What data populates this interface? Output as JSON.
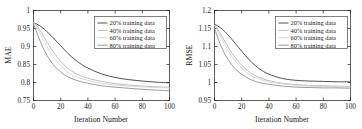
{
  "figure": {
    "panel_count": 2,
    "background": "#ffffff",
    "axis_color": "#1a1a1a"
  },
  "series_colors": [
    "#3d3d3d",
    "#b5b5b5",
    "#d2d2d2",
    "#8f8f8f"
  ],
  "legend": {
    "border_color": "#4a4a4a",
    "entries": [
      {
        "label": "20% training data",
        "color": "#3d3d3d"
      },
      {
        "label": "40% training data",
        "color": "#b5b5b5"
      },
      {
        "label": "60% training data",
        "color": "#d2d2d2"
      },
      {
        "label": "80% training data",
        "color": "#8f8f8f"
      }
    ]
  },
  "chart_data": [
    {
      "type": "line",
      "title": "",
      "xlabel": "Iteration Number",
      "ylabel": "MAE",
      "xlim": [
        0,
        100
      ],
      "ylim": [
        0.75,
        1
      ],
      "xticks": [
        0,
        20,
        40,
        60,
        80,
        100
      ],
      "yticks": [
        0.75,
        0.8,
        0.85,
        0.9,
        0.95,
        1
      ],
      "xticklabels": [
        "0",
        "20",
        "40",
        "60",
        "80",
        "100"
      ],
      "yticklabels": [
        "0.75",
        "0.8",
        "0.85",
        "0.9",
        "0.95",
        "1"
      ],
      "grid": false,
      "legend_position": "upper right",
      "x": [
        0,
        2,
        4,
        6,
        8,
        10,
        13,
        16,
        20,
        25,
        30,
        35,
        40,
        50,
        60,
        70,
        80,
        90,
        100
      ],
      "series": [
        {
          "name": "20% training data",
          "color": "#3d3d3d",
          "values": [
            0.966,
            0.963,
            0.959,
            0.954,
            0.948,
            0.941,
            0.93,
            0.918,
            0.902,
            0.882,
            0.865,
            0.851,
            0.84,
            0.824,
            0.814,
            0.808,
            0.804,
            0.801,
            0.799
          ]
        },
        {
          "name": "40% training data",
          "color": "#b5b5b5",
          "values": [
            0.968,
            0.96,
            0.95,
            0.938,
            0.925,
            0.912,
            0.894,
            0.878,
            0.859,
            0.84,
            0.827,
            0.818,
            0.812,
            0.803,
            0.797,
            0.793,
            0.79,
            0.788,
            0.787
          ]
        },
        {
          "name": "60% training data",
          "color": "#d2d2d2",
          "values": [
            0.967,
            0.956,
            0.943,
            0.928,
            0.913,
            0.899,
            0.88,
            0.864,
            0.846,
            0.829,
            0.818,
            0.811,
            0.806,
            0.798,
            0.793,
            0.79,
            0.788,
            0.786,
            0.785
          ]
        },
        {
          "name": "80% training data",
          "color": "#8f8f8f",
          "values": [
            0.963,
            0.943,
            0.923,
            0.905,
            0.889,
            0.875,
            0.857,
            0.843,
            0.829,
            0.816,
            0.808,
            0.802,
            0.798,
            0.791,
            0.787,
            0.784,
            0.781,
            0.779,
            0.777
          ]
        }
      ]
    },
    {
      "type": "line",
      "title": "",
      "xlabel": "Iteration Number",
      "ylabel": "RMSE",
      "xlim": [
        0,
        100
      ],
      "ylim": [
        0.95,
        1.2
      ],
      "xticks": [
        0,
        20,
        40,
        60,
        80,
        100
      ],
      "yticks": [
        0.95,
        1,
        1.05,
        1.1,
        1.15,
        1.2
      ],
      "xticklabels": [
        "0",
        "20",
        "40",
        "60",
        "80",
        "100"
      ],
      "yticklabels": [
        "0.95",
        "1",
        "1.05",
        "1.1",
        "1.15",
        "1.2"
      ],
      "grid": false,
      "legend_position": "upper right",
      "x": [
        0,
        2,
        4,
        6,
        8,
        10,
        13,
        16,
        20,
        25,
        30,
        35,
        40,
        50,
        60,
        70,
        80,
        90,
        100
      ],
      "series": [
        {
          "name": "20% training data",
          "color": "#3d3d3d",
          "values": [
            1.162,
            1.158,
            1.153,
            1.147,
            1.14,
            1.132,
            1.119,
            1.105,
            1.087,
            1.065,
            1.047,
            1.033,
            1.023,
            1.011,
            1.006,
            1.004,
            1.003,
            1.002,
            1.002
          ]
        },
        {
          "name": "40% training data",
          "color": "#b5b5b5",
          "values": [
            1.16,
            1.15,
            1.138,
            1.125,
            1.112,
            1.099,
            1.081,
            1.066,
            1.048,
            1.031,
            1.019,
            1.011,
            1.005,
            0.998,
            0.994,
            0.992,
            0.991,
            0.99,
            0.989
          ]
        },
        {
          "name": "60% training data",
          "color": "#d2d2d2",
          "values": [
            1.159,
            1.146,
            1.131,
            1.116,
            1.102,
            1.089,
            1.071,
            1.056,
            1.04,
            1.024,
            1.014,
            1.007,
            1.002,
            0.996,
            0.992,
            0.99,
            0.989,
            0.988,
            0.988
          ]
        },
        {
          "name": "80% training data",
          "color": "#8f8f8f",
          "values": [
            1.152,
            1.128,
            1.108,
            1.091,
            1.076,
            1.064,
            1.048,
            1.035,
            1.023,
            1.011,
            1.003,
            0.998,
            0.995,
            0.99,
            0.987,
            0.986,
            0.985,
            0.985,
            0.984
          ]
        }
      ]
    }
  ]
}
